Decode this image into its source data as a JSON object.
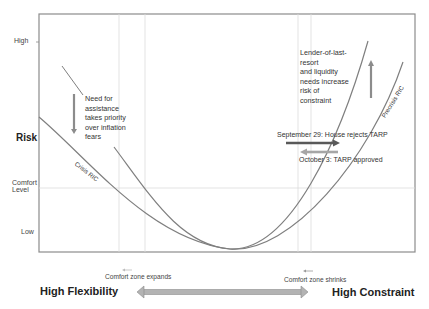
{
  "diagram": {
    "y_axis": {
      "title": "Risk",
      "ticks": [
        "High",
        "Comfort Level",
        "Low"
      ],
      "high": "High",
      "comfort_line1": "Comfort",
      "comfort_line2": "Level",
      "low": "Low"
    },
    "curves": [
      {
        "name": "Crisis RIC",
        "label": "Crisis RIC"
      },
      {
        "name": "Precrisis RIC",
        "label": "Precrisis RIC"
      }
    ],
    "annotations": {
      "left_note": [
        "Need for",
        "assistance",
        "takes priority",
        "over inflation",
        "fears"
      ],
      "right_note": [
        "Lender-of-last-",
        "resort",
        "and liquidity",
        "needs increase",
        "risk of",
        "constraint"
      ],
      "sept29": "September 29: House rejects TARP",
      "oct3": "October 3: TARP approved",
      "comfort_expands": "Comfort zone expands",
      "comfort_shrinks": "Comfort zone shrinks"
    },
    "x_axis": {
      "left_label": "High Flexibility",
      "right_label": "High Constraint"
    },
    "colors": {
      "curve": "#7f7f7f",
      "frame": "#8c8c8c",
      "gridline": "#d9d9d9",
      "arrow_dark": "#595959",
      "arrow_light": "#a6a6a6"
    }
  }
}
